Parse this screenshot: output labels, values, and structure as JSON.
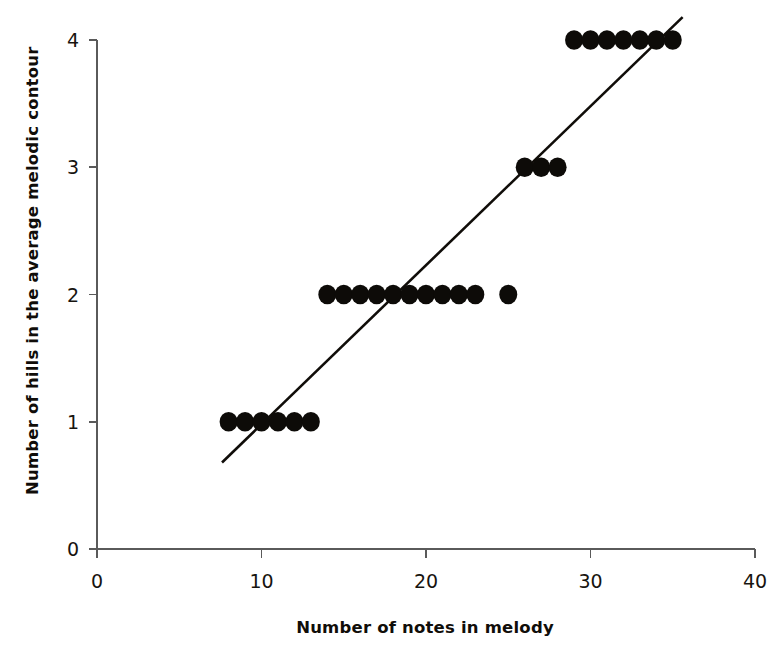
{
  "chart_data": {
    "type": "scatter",
    "title": "",
    "xlabel": "Number of notes in melody",
    "ylabel": "Number of hills in the average melodic contour",
    "xlim": [
      0,
      40
    ],
    "ylim": [
      0,
      4
    ],
    "xticks": [
      "0",
      "10",
      "20",
      "30",
      "40"
    ],
    "xtick_values": [
      0,
      10,
      20,
      30,
      40
    ],
    "yticks": [
      "0",
      "1",
      "2",
      "3",
      "4"
    ],
    "ytick_values": [
      0,
      1,
      2,
      3,
      4
    ],
    "grid": false,
    "legend": null,
    "marker": "filled-circle",
    "marker_color": "#0d0b08",
    "marker_size": 9,
    "x": [
      8,
      9,
      10,
      11,
      12,
      13,
      14,
      15,
      16,
      17,
      18,
      19,
      20,
      21,
      22,
      23,
      25,
      26,
      27,
      28,
      29,
      30,
      31,
      32,
      33,
      34,
      35
    ],
    "y": [
      1,
      1,
      1,
      1,
      1,
      1,
      2,
      2,
      2,
      2,
      2,
      2,
      2,
      2,
      2,
      2,
      2,
      3,
      3,
      3,
      4,
      4,
      4,
      4,
      4,
      4,
      4
    ],
    "points": [
      {
        "x": 8,
        "y": 1
      },
      {
        "x": 9,
        "y": 1
      },
      {
        "x": 10,
        "y": 1
      },
      {
        "x": 11,
        "y": 1
      },
      {
        "x": 12,
        "y": 1
      },
      {
        "x": 13,
        "y": 1
      },
      {
        "x": 14,
        "y": 2
      },
      {
        "x": 15,
        "y": 2
      },
      {
        "x": 16,
        "y": 2
      },
      {
        "x": 17,
        "y": 2
      },
      {
        "x": 18,
        "y": 2
      },
      {
        "x": 19,
        "y": 2
      },
      {
        "x": 20,
        "y": 2
      },
      {
        "x": 21,
        "y": 2
      },
      {
        "x": 22,
        "y": 2
      },
      {
        "x": 23,
        "y": 2
      },
      {
        "x": 25,
        "y": 2
      },
      {
        "x": 26,
        "y": 3
      },
      {
        "x": 27,
        "y": 3
      },
      {
        "x": 28,
        "y": 3
      },
      {
        "x": 29,
        "y": 4
      },
      {
        "x": 30,
        "y": 4
      },
      {
        "x": 31,
        "y": 4
      },
      {
        "x": 32,
        "y": 4
      },
      {
        "x": 33,
        "y": 4
      },
      {
        "x": 34,
        "y": 4
      },
      {
        "x": 35,
        "y": 4
      }
    ],
    "trendline": {
      "type": "linear",
      "x_start": 7.6,
      "y_start": 0.68,
      "x_end": 35.6,
      "y_end": 4.18,
      "color": "#100d09"
    }
  }
}
